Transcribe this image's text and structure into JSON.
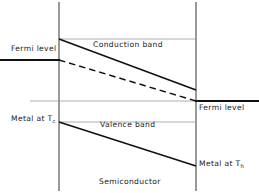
{
  "figure": {
    "kind": "energy-band-diagram",
    "caption": "Semiconductor",
    "colors": {
      "band_line": "#111111",
      "reference_line": "#8a8a8a",
      "boundary_line": "#6e6e6e",
      "text": "#1a1a1a",
      "background": "#ffffff"
    }
  },
  "labels": {
    "fermi_level_left": "Fermi level",
    "fermi_level_right": "Fermi level",
    "conduction_band": "Conduction band",
    "valence_band": "Valence band",
    "metal_cold_prefix": "Metal at T",
    "metal_cold_subscript": "c",
    "metal_hot_prefix": "Metal at T",
    "metal_hot_subscript": "h",
    "semiconductor": "Semiconductor"
  },
  "geometry": {
    "left_boundary_x": 59,
    "right_boundary_x": 196,
    "conduction_band_start_y": 39,
    "conduction_band_end_y": 90,
    "fermi_left_y": 60,
    "fermi_right_y": 101,
    "valence_band_start_y": 122,
    "valence_band_end_y": 166
  }
}
